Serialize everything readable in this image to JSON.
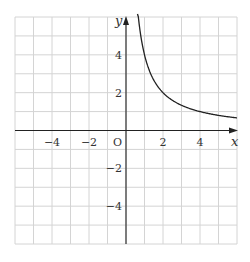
{
  "chart_data": {
    "type": "line",
    "title": "",
    "function": "y = 4/x (x > 0)",
    "series": [
      {
        "name": "y = 4/x",
        "x": [
          0.667,
          1,
          1.5,
          2,
          2.5,
          3,
          4,
          5,
          6
        ],
        "y": [
          6,
          4,
          2.667,
          2,
          1.6,
          1.333,
          1,
          0.8,
          0.667
        ]
      }
    ],
    "xlabel": "x",
    "ylabel": "y",
    "origin_label": "O",
    "xlim": [
      -6,
      6
    ],
    "ylim": [
      -6,
      6
    ],
    "grid": true,
    "grid_step": 1,
    "x_ticks": [
      {
        "value": -4,
        "label": "−4"
      },
      {
        "value": -2,
        "label": "−2"
      },
      {
        "value": 2,
        "label": "2"
      },
      {
        "value": 4,
        "label": "4"
      }
    ],
    "y_ticks": [
      {
        "value": 4,
        "label": "4"
      },
      {
        "value": 2,
        "label": "2"
      },
      {
        "value": -2,
        "label": "−2"
      },
      {
        "value": -4,
        "label": "−4"
      }
    ]
  }
}
